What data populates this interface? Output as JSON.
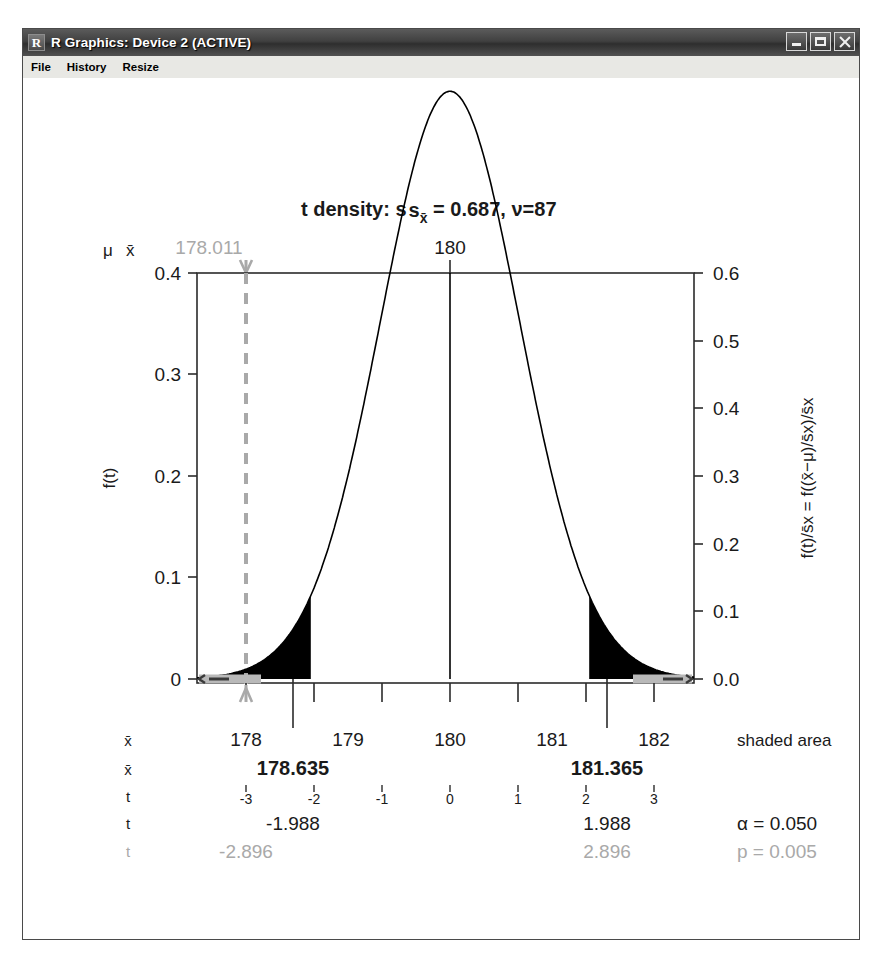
{
  "window": {
    "title": "R Graphics: Device 2 (ACTIVE)",
    "icon": "R",
    "buttons": {
      "minimize": "minimize-icon",
      "maximize": "maximize-icon",
      "close": "close-icon"
    },
    "menu": [
      "File",
      "History",
      "Resize"
    ]
  },
  "chart_data": {
    "type": "line",
    "title": "t density:  s",
    "title_sub": "x̄",
    "title_rest": " = 0.687, ν=87",
    "title_full": "t density:  s_x̄ = 0.687, ν=87",
    "distribution": "t",
    "df": 87,
    "se": 0.687,
    "mean": 180,
    "ylabel_left": "f(t)",
    "ylabel_right": "f(t)/s̄x = f((x̄−μ)/s̄x)/s̄x",
    "xlabel": "",
    "left_axis": {
      "ticks": [
        0,
        0.1,
        0.2,
        0.3,
        0.4
      ],
      "labels": [
        "0",
        "0.1",
        "0.2",
        "0.3",
        "0.4"
      ],
      "ylim": [
        0,
        0.4
      ]
    },
    "right_axis": {
      "ticks": [
        0.0,
        0.1,
        0.2,
        0.3,
        0.4,
        0.5,
        0.6
      ],
      "labels": [
        "0.0",
        "0.1",
        "0.2",
        "0.3",
        "0.4",
        "0.5",
        "0.6"
      ],
      "ylim": [
        0,
        0.6
      ]
    },
    "top_axis": {
      "labels": [
        "178.011",
        "180"
      ],
      "values": [
        178.011,
        180
      ]
    },
    "top_left_labels": [
      "μ",
      "x̄"
    ],
    "x_axis_xbar": {
      "label": "x̄",
      "ticks": [
        178,
        179,
        180,
        181,
        182
      ],
      "labels": [
        "178",
        "179",
        "180",
        "181",
        "182"
      ]
    },
    "x_axis_t": {
      "label": "t",
      "ticks": [
        -3,
        -2,
        -1,
        0,
        1,
        2,
        3
      ],
      "labels": [
        "-3",
        "-2",
        "-1",
        "0",
        "1",
        "2",
        "3"
      ]
    },
    "critical_row": {
      "label": "x̄",
      "left": "178.635",
      "right": "181.365"
    },
    "t_critical_row": {
      "label": "t",
      "left": "-1.988",
      "right": "1.988",
      "note": "α = 0.050"
    },
    "t_observed_row": {
      "label": "t",
      "left": "-2.896",
      "right": "2.896",
      "note": "p = 0.005"
    },
    "shaded_area_label": "shaded area",
    "alpha": 0.05,
    "p_value": 0.005,
    "t_crit": 1.988,
    "t_obs": 2.896,
    "xbar_crit_low": 178.635,
    "xbar_crit_high": 181.365,
    "xbar_observed": 178.011,
    "colors": {
      "curve": "#000000",
      "shade": "#000000",
      "gray_annotation": "#a9a9a9",
      "frame": "#2b2b2b"
    },
    "legend": [],
    "grid": false
  }
}
